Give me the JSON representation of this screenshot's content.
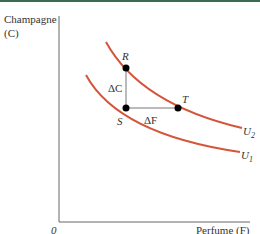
{
  "figure": {
    "y_axis_label_line1": "Champagne",
    "y_axis_label_line2": "(C)",
    "x_axis_label": "Perfume (F)",
    "origin_label": "0",
    "points": {
      "R": "R",
      "S": "S",
      "T": "T"
    },
    "deltas": {
      "delta_c": "ΔC",
      "delta_f": "ΔF"
    },
    "curves": {
      "u2": "U",
      "u2_sub": "2",
      "u1": "U",
      "u1_sub": "1"
    },
    "colors": {
      "curve": "#d4553a",
      "axis": "#555555",
      "points": "#000000",
      "top_border": "#3d6b4f"
    }
  }
}
